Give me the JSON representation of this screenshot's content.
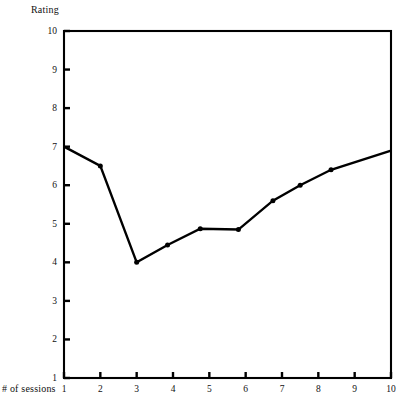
{
  "chart_data": {
    "type": "line",
    "title": "",
    "ylabel": "Rating",
    "xlabel": "# of sessions",
    "xlim": [
      1,
      10
    ],
    "ylim": [
      1,
      10
    ],
    "grid": false,
    "legend": "none",
    "x_ticks": [
      "1",
      "2",
      "3",
      "4",
      "5",
      "6",
      "7",
      "8",
      "9",
      "10"
    ],
    "x_tick_values": [
      1,
      2,
      3,
      4,
      5,
      6,
      7,
      8,
      9,
      10
    ],
    "y_ticks": [
      "1",
      "2",
      "3",
      "4",
      "5",
      "6",
      "7",
      "8",
      "9",
      "10"
    ],
    "y_tick_values": [
      1,
      2,
      3,
      4,
      5,
      6,
      7,
      8,
      9,
      10
    ],
    "series": [
      {
        "name": "Rating",
        "marker": "filled-circle",
        "color": "#000000",
        "points": [
          {
            "x": 1.0,
            "y": 7.0
          },
          {
            "x": 2.0,
            "y": 6.5
          },
          {
            "x": 3.0,
            "y": 4.0
          },
          {
            "x": 3.85,
            "y": 4.45
          },
          {
            "x": 4.75,
            "y": 4.87
          },
          {
            "x": 5.8,
            "y": 4.85
          },
          {
            "x": 6.75,
            "y": 5.6
          },
          {
            "x": 7.5,
            "y": 6.0
          },
          {
            "x": 8.35,
            "y": 6.4
          },
          {
            "x": 10.0,
            "y": 6.9
          }
        ]
      }
    ],
    "frame": {
      "color": "#000000",
      "style": "full-box"
    }
  },
  "labels": {
    "y_axis_title": "Rating",
    "x_axis_title": "# of sessions"
  }
}
